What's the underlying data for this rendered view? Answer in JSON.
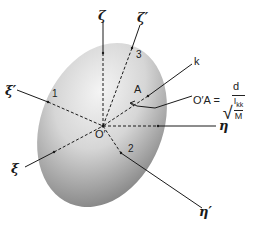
{
  "diagram": {
    "type": "ellipsoid-of-inertia",
    "shape": "shaded ellipsoid",
    "origin_label": "O′",
    "axes": [
      {
        "id": "zeta",
        "label": "ζ"
      },
      {
        "id": "zeta-prime",
        "label": "ζ′"
      },
      {
        "id": "xi-prime",
        "label": "ξ′"
      },
      {
        "id": "xi",
        "label": "ξ"
      },
      {
        "id": "eta",
        "label": "η"
      },
      {
        "id": "eta-prime",
        "label": "η′"
      },
      {
        "id": "k",
        "label": "k"
      }
    ],
    "principal_axis_numbers": [
      "1",
      "2",
      "3"
    ],
    "point_label": "A",
    "formula": {
      "lhs": "O′A =",
      "numerator": "d",
      "radicand_numerator": "I",
      "radicand_subscript": "kk",
      "radicand_denominator": "M"
    },
    "colors": {
      "line": "#1a1a1a",
      "shade_light": "#f2f2f2",
      "shade_dark": "#7a7a7a"
    }
  }
}
